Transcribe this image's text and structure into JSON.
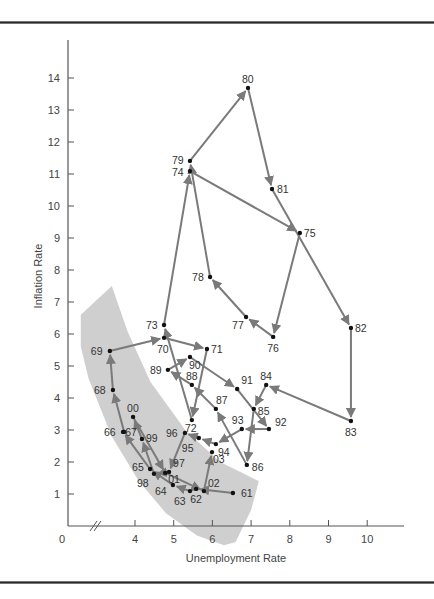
{
  "chart_data": {
    "type": "scatter",
    "subtype": "connected-scatter",
    "title": "",
    "xlabel": "Unemployment Rate",
    "ylabel": "Inflation Rate",
    "xlim": [
      3,
      10.5
    ],
    "ylim": [
      0,
      15
    ],
    "x_axis_break": true,
    "x_ticks": [
      {
        "value": 0,
        "label": "0",
        "origin": true
      },
      {
        "value": 4,
        "label": "4"
      },
      {
        "value": 5,
        "label": "5"
      },
      {
        "value": 6,
        "label": "6"
      },
      {
        "value": 7,
        "label": "7"
      },
      {
        "value": 8,
        "label": "8"
      },
      {
        "value": 9,
        "label": "9"
      },
      {
        "value": 10,
        "label": "10"
      }
    ],
    "y_ticks": [
      1,
      2,
      3,
      4,
      5,
      6,
      7,
      8,
      9,
      10,
      11,
      12,
      13,
      14
    ],
    "grid": false,
    "legend": null,
    "annotation": "Shaded band marks the downward-sloping Phillips-curve region (1960s and late 1990s–early 2000s points)",
    "colors": {
      "line": "#7a7a7a",
      "point": "#111111",
      "band": "#cfcfcf",
      "axis": "#555555"
    },
    "points": [
      {
        "label": "61",
        "x": 6.53,
        "y": 1.03,
        "lx": 8,
        "ly": 4
      },
      {
        "label": "62",
        "x": 5.58,
        "y": 1.16,
        "lx": -6,
        "ly": 14
      },
      {
        "label": "63",
        "x": 5.42,
        "y": 1.09,
        "lx": -16,
        "ly": 14
      },
      {
        "label": "64",
        "x": 4.98,
        "y": 1.28,
        "lx": -18,
        "ly": 10
      },
      {
        "label": "65",
        "x": 4.39,
        "y": 1.78,
        "lx": -18,
        "ly": 2
      },
      {
        "label": "66",
        "x": 3.69,
        "y": 2.94,
        "lx": -19,
        "ly": 4
      },
      {
        "label": "67",
        "x": 3.72,
        "y": 2.94,
        "lx": 1,
        "ly": 4
      },
      {
        "label": "68",
        "x": 3.43,
        "y": 4.25,
        "lx": -19,
        "ly": 4
      },
      {
        "label": "69",
        "x": 3.35,
        "y": 5.47,
        "lx": -19,
        "ly": 4
      },
      {
        "label": "70",
        "x": 4.75,
        "y": 5.88,
        "lx": -7,
        "ly": 15
      },
      {
        "label": "71",
        "x": 5.86,
        "y": 5.53,
        "lx": 4,
        "ly": 4
      },
      {
        "label": "72",
        "x": 5.47,
        "y": 3.31,
        "lx": -7,
        "ly": 12
      },
      {
        "label": "73",
        "x": 4.75,
        "y": 6.28,
        "lx": -18,
        "ly": 4
      },
      {
        "label": "74",
        "x": 5.42,
        "y": 11.09,
        "lx": -18,
        "ly": 5
      },
      {
        "label": "75",
        "x": 8.26,
        "y": 9.16,
        "lx": 4,
        "ly": 4
      },
      {
        "label": "76",
        "x": 7.57,
        "y": 5.91,
        "lx": -6,
        "ly": 15
      },
      {
        "label": "77",
        "x": 6.87,
        "y": 6.53,
        "lx": -14,
        "ly": 12
      },
      {
        "label": "78",
        "x": 5.94,
        "y": 7.78,
        "lx": -18,
        "ly": 4
      },
      {
        "label": "79",
        "x": 5.42,
        "y": 11.41,
        "lx": -18,
        "ly": 3
      },
      {
        "label": "80",
        "x": 6.92,
        "y": 13.69,
        "lx": -6,
        "ly": -5
      },
      {
        "label": "81",
        "x": 7.54,
        "y": 10.53,
        "lx": 5,
        "ly": 4
      },
      {
        "label": "82",
        "x": 9.58,
        "y": 6.19,
        "lx": 4,
        "ly": 4
      },
      {
        "label": "83",
        "x": 9.58,
        "y": 3.28,
        "lx": -6,
        "ly": 15
      },
      {
        "label": "84",
        "x": 7.39,
        "y": 4.41,
        "lx": -6,
        "ly": -5
      },
      {
        "label": "85",
        "x": 7.07,
        "y": 3.66,
        "lx": 4,
        "ly": 6
      },
      {
        "label": "86",
        "x": 6.89,
        "y": 1.91,
        "lx": 5,
        "ly": 6
      },
      {
        "label": "87",
        "x": 6.09,
        "y": 3.66,
        "lx": 0,
        "ly": -5
      },
      {
        "label": "88",
        "x": 5.47,
        "y": 4.41,
        "lx": -6,
        "ly": -5
      },
      {
        "label": "89",
        "x": 4.85,
        "y": 4.88,
        "lx": -18,
        "ly": 4
      },
      {
        "label": "90",
        "x": 5.42,
        "y": 5.28,
        "lx": -1,
        "ly": 12
      },
      {
        "label": "91",
        "x": 6.64,
        "y": 4.28,
        "lx": 4,
        "ly": -5
      },
      {
        "label": "92",
        "x": 7.46,
        "y": 3.03,
        "lx": 6,
        "ly": -3
      },
      {
        "label": "93",
        "x": 6.76,
        "y": 3.03,
        "lx": -10,
        "ly": -5
      },
      {
        "label": "94",
        "x": 6.09,
        "y": 2.56,
        "lx": 2,
        "ly": 12
      },
      {
        "label": "95",
        "x": 5.65,
        "y": 2.75,
        "lx": -17,
        "ly": 14
      },
      {
        "label": "96",
        "x": 5.29,
        "y": 2.91,
        "lx": -19,
        "ly": 4
      },
      {
        "label": "97",
        "x": 4.88,
        "y": 1.69,
        "lx": 4,
        "ly": -5
      },
      {
        "label": "98",
        "x": 4.49,
        "y": 1.63,
        "lx": -17,
        "ly": 13
      },
      {
        "label": "99",
        "x": 4.18,
        "y": 2.72,
        "lx": 4,
        "ly": 3
      },
      {
        "label": "00",
        "x": 3.95,
        "y": 3.41,
        "lx": -6,
        "ly": -5
      },
      {
        "label": "01",
        "x": 4.78,
        "y": 1.66,
        "lx": 3,
        "ly": 10
      },
      {
        "label": "02",
        "x": 5.78,
        "y": 1.09,
        "lx": 4,
        "ly": -4
      },
      {
        "label": "03",
        "x": 5.99,
        "y": 2.31,
        "lx": 1,
        "ly": 11
      }
    ],
    "band": [
      [
        2.6,
        6.6
      ],
      [
        3.4,
        7.5
      ],
      [
        3.8,
        6.1
      ],
      [
        4.4,
        4.5
      ],
      [
        5.3,
        3.0
      ],
      [
        6.2,
        2.0
      ],
      [
        7.2,
        1.4
      ],
      [
        7.0,
        0.5
      ],
      [
        6.6,
        -0.5
      ],
      [
        6.3,
        -0.6
      ],
      [
        5.6,
        -0.3
      ],
      [
        4.8,
        0.4
      ],
      [
        4.1,
        1.4
      ],
      [
        3.4,
        2.8
      ],
      [
        2.8,
        4.6
      ],
      [
        2.6,
        5.6
      ]
    ]
  }
}
